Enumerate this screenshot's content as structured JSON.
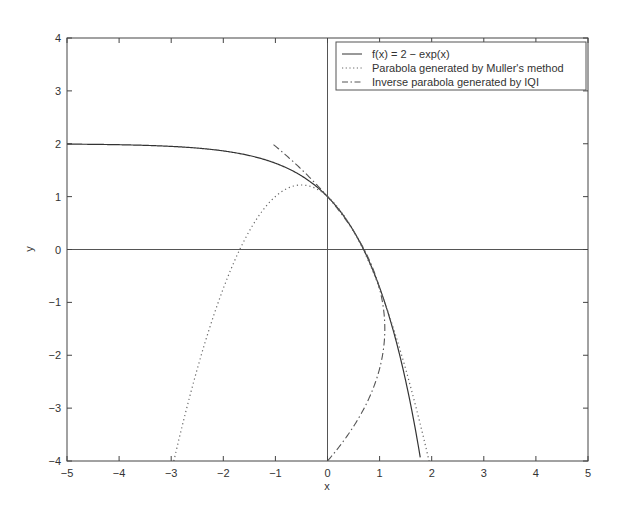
{
  "chart_data": {
    "type": "line",
    "title": "",
    "xlabel": "x",
    "ylabel": "y",
    "xlim": [
      -5,
      5
    ],
    "ylim": [
      -4,
      4
    ],
    "xticks": [
      -5,
      -4,
      -3,
      -2,
      -1,
      0,
      1,
      2,
      3,
      4,
      5
    ],
    "yticks": [
      -4,
      -3,
      -2,
      -1,
      0,
      1,
      2,
      3,
      4
    ],
    "xtick_labels": [
      "−5",
      "−4",
      "−3",
      "−2",
      "−1",
      "0",
      "1",
      "2",
      "3",
      "4",
      "5"
    ],
    "ytick_labels": [
      "−4",
      "−3",
      "−2",
      "−1",
      "0",
      "1",
      "2",
      "3",
      "4"
    ],
    "grid": false,
    "reference_lines": [
      {
        "orientation": "horizontal",
        "value": 0
      },
      {
        "orientation": "vertical",
        "value": 0
      }
    ],
    "legend_position": "upper right",
    "series": [
      {
        "name": "f(x) = 2 − exp(x)",
        "style": "solid",
        "expression": "y = 2 - exp(x)",
        "x_range": [
          -5,
          1.79
        ],
        "points": [
          [
            -5,
            1.99
          ],
          [
            -4,
            1.98
          ],
          [
            -3,
            1.95
          ],
          [
            -2,
            1.86
          ],
          [
            -1,
            1.63
          ],
          [
            0,
            1.0
          ],
          [
            0.5,
            0.35
          ],
          [
            1,
            -0.72
          ],
          [
            1.5,
            -2.48
          ],
          [
            1.79,
            -4.0
          ]
        ]
      },
      {
        "name": "Parabola generated by Muller's method",
        "style": "dotted",
        "expression": "y = -0.87 (x + 0.5)^2 + 1.22",
        "x_range": [
          -2.95,
          1.95
        ],
        "points": [
          [
            -2.95,
            -4.0
          ],
          [
            -2,
            -0.74
          ],
          [
            -1.8,
            -0.25
          ],
          [
            -1,
            1.0
          ],
          [
            -0.5,
            1.22
          ],
          [
            0,
            1.0
          ],
          [
            0.5,
            0.35
          ],
          [
            1,
            -0.74
          ],
          [
            1.5,
            -2.26
          ],
          [
            1.95,
            -4.0
          ]
        ]
      },
      {
        "name": "Inverse parabola generated by IQI",
        "style": "dashdot",
        "expression": "x = -0.176 (y + 1.5)^2 + 1.1",
        "y_range": [
          -4,
          2
        ],
        "points": [
          [
            0,
            -4.0
          ],
          [
            0.7,
            -3.0
          ],
          [
            1.06,
            -2.0
          ],
          [
            1.1,
            -1.5
          ],
          [
            0.94,
            -0.5
          ],
          [
            0.62,
            0.0
          ],
          [
            0.0,
            1.0
          ],
          [
            -1.06,
            2.0
          ]
        ]
      }
    ]
  },
  "legend": {
    "items": [
      {
        "label": "f(x) = 2 − exp(x)"
      },
      {
        "label": "Parabola generated by Muller's method"
      },
      {
        "label": "Inverse parabola generated by IQI"
      }
    ]
  },
  "axes": {
    "xlabel": "x",
    "ylabel": "y"
  }
}
